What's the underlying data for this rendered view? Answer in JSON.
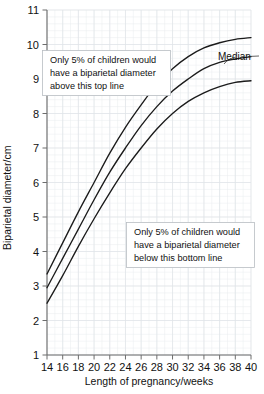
{
  "chart_data": {
    "type": "line",
    "title": "",
    "xlabel": "Length of pregnancy/weeks",
    "ylabel": "Biparietal diameter/cm",
    "xlim": [
      14,
      40
    ],
    "ylim": [
      1,
      11
    ],
    "grid": true,
    "legend_position": "inline-annotation",
    "x_ticks": [
      14,
      16,
      18,
      20,
      22,
      24,
      26,
      28,
      30,
      32,
      34,
      36,
      38,
      40
    ],
    "y_ticks": [
      1,
      2,
      3,
      4,
      5,
      6,
      7,
      8,
      9,
      10,
      11
    ],
    "x": [
      14,
      16,
      18,
      20,
      22,
      24,
      26,
      28,
      30,
      32,
      34,
      36,
      38,
      40
    ],
    "series": [
      {
        "name": "95th centile (top line)",
        "values": [
          3.35,
          4.25,
          5.15,
          6.0,
          6.85,
          7.6,
          8.25,
          8.85,
          9.3,
          9.65,
          9.9,
          10.05,
          10.15,
          10.2
        ]
      },
      {
        "name": "Median",
        "values": [
          2.95,
          3.8,
          4.65,
          5.5,
          6.3,
          7.0,
          7.65,
          8.2,
          8.65,
          9.0,
          9.3,
          9.48,
          9.58,
          9.65
        ]
      },
      {
        "name": "5th centile (bottom line)",
        "values": [
          2.5,
          3.3,
          4.15,
          4.95,
          5.7,
          6.4,
          7.0,
          7.55,
          8.0,
          8.35,
          8.6,
          8.78,
          8.9,
          8.95
        ]
      }
    ],
    "annotations": [
      {
        "id": "top-note",
        "lines": [
          "Only 5% of children would",
          "have a biparietal diameter",
          "above this top line"
        ]
      },
      {
        "id": "bottom-note",
        "lines": [
          "Only 5% of children would",
          "have a biparietal diameter",
          "below this bottom line"
        ]
      },
      {
        "id": "median-label",
        "text": "Median"
      }
    ],
    "colors": {
      "curve": "#1b1b1b",
      "axis": "#6d6d6d",
      "grid_minor": "#e9ecef",
      "grid_major": "#dfe4e8",
      "callout_border": "#b9bdc2",
      "background": "#ffffff"
    }
  }
}
